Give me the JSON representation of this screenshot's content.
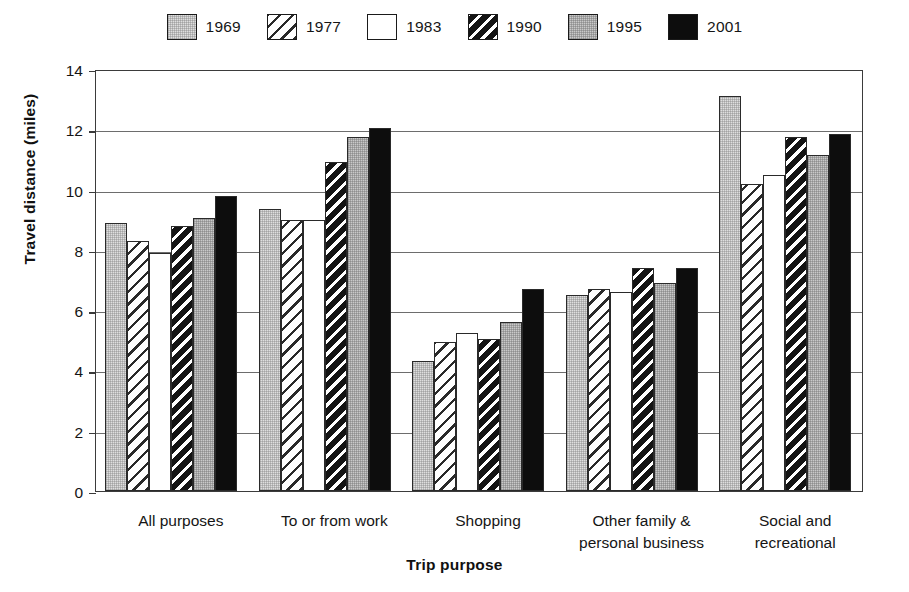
{
  "chart_data": {
    "type": "bar",
    "title": "",
    "xlabel": "Trip purpose",
    "ylabel": "Travel distance (miles)",
    "ylim": [
      0,
      14
    ],
    "ytick_step": 2,
    "yticks": [
      0,
      2,
      4,
      6,
      8,
      10,
      12,
      14
    ],
    "ytick_labels": [
      "0",
      "2",
      "4",
      "6",
      "8",
      "10",
      "12",
      "14"
    ],
    "grid": "horizontal",
    "legend_position": "top-center",
    "categories": [
      "All purposes",
      "To or from work",
      "Shopping",
      "Other family &\npersonal business",
      "Social and recreational"
    ],
    "series": [
      {
        "name": "1969",
        "pattern": "solid-light-stipple",
        "values": [
          8.9,
          9.35,
          4.3,
          6.5,
          13.1
        ]
      },
      {
        "name": "1977",
        "pattern": "diagonal-hatch-light",
        "values": [
          8.3,
          9.0,
          4.95,
          6.7,
          10.2
        ]
      },
      {
        "name": "1983",
        "pattern": "white",
        "values": [
          7.9,
          9.0,
          5.25,
          6.6,
          10.5
        ]
      },
      {
        "name": "1990",
        "pattern": "diagonal-hatch-dark",
        "values": [
          8.8,
          10.9,
          5.05,
          7.4,
          11.75
        ]
      },
      {
        "name": "1995",
        "pattern": "grey-stipple",
        "values": [
          9.05,
          11.75,
          5.6,
          6.9,
          11.15
        ]
      },
      {
        "name": "2001",
        "pattern": "solid-black",
        "values": [
          9.8,
          12.05,
          6.7,
          7.4,
          11.85
        ]
      }
    ]
  },
  "legend": {
    "items": [
      {
        "label": "1969",
        "fill_class": "fill-solid-light"
      },
      {
        "label": "1977",
        "fill_class": "fill-hatch-light"
      },
      {
        "label": "1983",
        "fill_class": "fill-white"
      },
      {
        "label": "1990",
        "fill_class": "fill-hatch-dark"
      },
      {
        "label": "1995",
        "fill_class": "fill-grey"
      },
      {
        "label": "2001",
        "fill_class": "fill-black"
      }
    ]
  },
  "colors": {
    "axis": "#3b3b3b",
    "gridline": "#6d6d6d",
    "text": "#151515",
    "bar_outline": "#2a2a2a",
    "background": "#ffffff"
  }
}
